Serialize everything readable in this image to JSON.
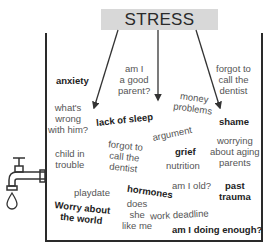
{
  "title": "STRESS",
  "words": [
    {
      "id": "anxiety",
      "text": "anxiety",
      "bold": true,
      "x": 56,
      "y": 75,
      "rot": 0
    },
    {
      "id": "am-i-good-parent",
      "text": "am I\na good\nparent?",
      "bold": false,
      "x": 118,
      "y": 63,
      "rot": 0
    },
    {
      "id": "forgot-dentist-1",
      "text": "forgot to\ncall the\ndentist",
      "bold": false,
      "x": 216,
      "y": 63,
      "rot": 0
    },
    {
      "id": "money-problems",
      "text": "money\nproblems",
      "bold": false,
      "x": 174,
      "y": 92,
      "rot": 8
    },
    {
      "id": "whats-wrong",
      "text": "what's\nwrong\nwith him?",
      "bold": false,
      "x": 48,
      "y": 102,
      "rot": 0
    },
    {
      "id": "lack-of-sleep",
      "text": "lack of sleep",
      "bold": true,
      "x": 96,
      "y": 114,
      "rot": -6
    },
    {
      "id": "shame",
      "text": "shame",
      "bold": true,
      "x": 219,
      "y": 116,
      "rot": 0
    },
    {
      "id": "argument",
      "text": "argument",
      "bold": false,
      "x": 152,
      "y": 128,
      "rot": -12
    },
    {
      "id": "forgot-dentist-2",
      "text": "forgot to\ncall the\ndentist",
      "bold": false,
      "x": 107,
      "y": 140,
      "rot": 6
    },
    {
      "id": "worrying-parents",
      "text": "worrying\nabout aging\nparents",
      "bold": false,
      "x": 210,
      "y": 135,
      "rot": 0
    },
    {
      "id": "child-in-trouble",
      "text": "child in\ntrouble",
      "bold": false,
      "x": 55,
      "y": 148,
      "rot": 0
    },
    {
      "id": "grief",
      "text": "grief",
      "bold": true,
      "x": 175,
      "y": 146,
      "rot": 0
    },
    {
      "id": "nutrition",
      "text": "nutrition",
      "bold": false,
      "x": 166,
      "y": 160,
      "rot": 0
    },
    {
      "id": "playdate",
      "text": "playdate",
      "bold": false,
      "x": 74,
      "y": 187,
      "rot": 0
    },
    {
      "id": "hormones",
      "text": "hormones",
      "bold": true,
      "x": 127,
      "y": 186,
      "rot": 8
    },
    {
      "id": "am-i-old",
      "text": "am I old?",
      "bold": false,
      "x": 172,
      "y": 180,
      "rot": 0
    },
    {
      "id": "past-trauma",
      "text": "past\ntrauma",
      "bold": true,
      "x": 219,
      "y": 180,
      "rot": 0
    },
    {
      "id": "worry-world",
      "text": "Worry about\nthe world",
      "bold": true,
      "x": 54,
      "y": 202,
      "rot": 6
    },
    {
      "id": "does-she-like-me",
      "text": "does\nshe\nlike me",
      "bold": false,
      "x": 122,
      "y": 198,
      "rot": 0
    },
    {
      "id": "work-deadline",
      "text": "work deadline",
      "bold": false,
      "x": 150,
      "y": 209,
      "rot": -3
    },
    {
      "id": "am-i-doing-enough",
      "text": "am I doing enough?",
      "bold": true,
      "x": 172,
      "y": 224,
      "rot": 0
    }
  ],
  "arrows": [
    {
      "from": [
        118,
        30
      ],
      "to": [
        94,
        108
      ]
    },
    {
      "from": [
        158,
        30
      ],
      "to": [
        158,
        100
      ]
    },
    {
      "from": [
        196,
        30
      ],
      "to": [
        220,
        108
      ]
    }
  ],
  "icons": {
    "faucet": "faucet-icon",
    "drop": "water-drop-icon"
  }
}
